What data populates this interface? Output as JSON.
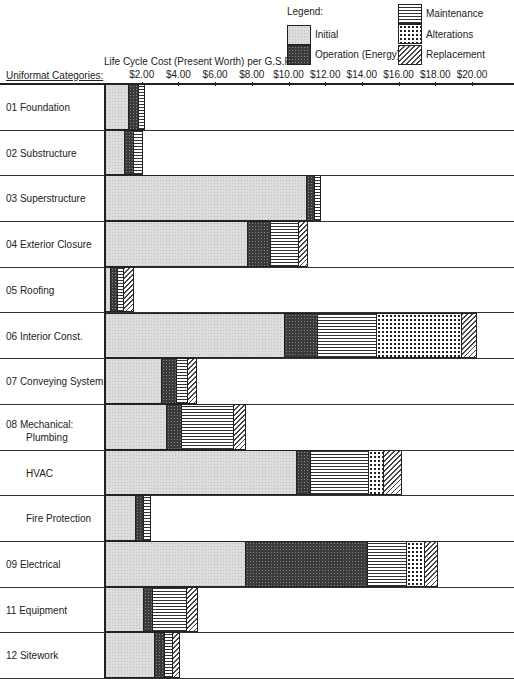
{
  "legend": {
    "title": "Legend:",
    "items": [
      {
        "key": "initial",
        "label": "Initial"
      },
      {
        "key": "operation",
        "label": "Operation (Energy)"
      },
      {
        "key": "maintenance",
        "label": "Maintenance"
      },
      {
        "key": "alterations",
        "label": "Alterations"
      },
      {
        "key": "replacement",
        "label": "Replacement"
      }
    ]
  },
  "axis": {
    "title": "Life Cycle Cost (Present Worth) per G.S.F.:",
    "category_title": "Uniformat Categories:",
    "ticks": [
      "$2.00",
      "$4.00",
      "$6.00",
      "$8.00",
      "$10.00",
      "$12.00",
      "$14.00",
      "$16.00",
      "$18.00",
      "$20.00"
    ]
  },
  "chart_data": {
    "type": "bar",
    "orientation": "horizontal",
    "stacked": true,
    "title": "",
    "xlabel": "Life Cycle Cost (Present Worth) per G.S.F.",
    "ylabel": "Uniformat Categories",
    "xlim": [
      0,
      22
    ],
    "x_ticks": [
      2,
      4,
      6,
      8,
      10,
      12,
      14,
      16,
      18,
      20
    ],
    "x_tick_labels": [
      "$2.00",
      "$4.00",
      "$6.00",
      "$8.00",
      "$10.00",
      "$12.00",
      "$14.00",
      "$16.00",
      "$18.00",
      "$20.00"
    ],
    "grid": false,
    "legend_position": "top-right",
    "categories": [
      "01 Foundation",
      "02 Substructure",
      "03 Superstructure",
      "04 Exterior Closure",
      "05 Roofing",
      "06 Interior Const.",
      "07 Conveying System",
      "08 Mechanical: Plumbing",
      "HVAC",
      "Fire Protection",
      "09 Electrical",
      "11 Equipment",
      "12 Sitework"
    ],
    "series": [
      {
        "name": "Initial",
        "values": [
          1.3,
          1.1,
          11.0,
          7.8,
          0.35,
          9.8,
          3.1,
          3.4,
          10.45,
          1.7,
          7.7,
          2.1,
          2.7
        ]
      },
      {
        "name": "Operation (Energy)",
        "values": [
          0.55,
          0.5,
          0.45,
          1.25,
          0.35,
          1.8,
          0.85,
          0.8,
          0.75,
          0.4,
          6.65,
          0.5,
          0.55
        ]
      },
      {
        "name": "Maintenance",
        "values": [
          0.35,
          0.45,
          0.3,
          1.5,
          0.35,
          3.25,
          0.55,
          2.85,
          3.2,
          0.4,
          2.1,
          1.85,
          0.45
        ]
      },
      {
        "name": "Alterations",
        "values": [
          0,
          0,
          0,
          0,
          0,
          4.6,
          0,
          0,
          0.8,
          0,
          1.0,
          0,
          0
        ]
      },
      {
        "name": "Replacement",
        "values": [
          0,
          0,
          0,
          0.5,
          0.55,
          0.8,
          0.5,
          0.65,
          1.0,
          0,
          0.7,
          0.6,
          0.4
        ]
      }
    ]
  },
  "rows": [
    {
      "label": "01  Foundation",
      "sub": "",
      "indent": false
    },
    {
      "label": "02  Substructure",
      "sub": "",
      "indent": false
    },
    {
      "label": "03  Superstructure",
      "sub": "",
      "indent": false
    },
    {
      "label": "04  Exterior Closure",
      "sub": "",
      "indent": false
    },
    {
      "label": "05  Roofing",
      "sub": "",
      "indent": false
    },
    {
      "label": "06  Interior Const.",
      "sub": "",
      "indent": false
    },
    {
      "label": "07  Conveying System",
      "sub": "",
      "indent": false
    },
    {
      "label": "08  Mechanical:",
      "sub": "Plumbing",
      "indent": false
    },
    {
      "label": "HVAC",
      "sub": "",
      "indent": true
    },
    {
      "label": "Fire Protection",
      "sub": "",
      "indent": true
    },
    {
      "label": "09  Electrical",
      "sub": "",
      "indent": false
    },
    {
      "label": "11  Equipment",
      "sub": "",
      "indent": false
    },
    {
      "label": "12  Sitework",
      "sub": "",
      "indent": false
    }
  ]
}
